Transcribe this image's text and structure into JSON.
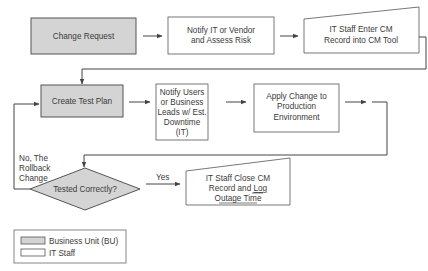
{
  "diagram": {
    "colors": {
      "business_unit_fill": "#d4d4d4",
      "it_staff_fill": "#ffffff",
      "stroke": "#555555",
      "text": "#3a3a3a"
    },
    "nodes": {
      "change_request": {
        "label": "Change Request",
        "owner": "Business Unit (BU)"
      },
      "notify_it": {
        "line1": "Notify IT or Vendor",
        "line2": "and Assess Risk",
        "owner": "IT Staff"
      },
      "enter_cm": {
        "line1": "IT Staff Enter CM",
        "line2": "Record into CM Tool",
        "owner": "IT Staff"
      },
      "create_test_plan": {
        "label": "Create Test Plan",
        "owner": "Business Unit (BU)"
      },
      "notify_users": {
        "line1": "Notify Users",
        "line2": "or Business",
        "line3": "Leads w/ Est.",
        "line4": "Downtime",
        "line5": "(IT)",
        "owner": "IT Staff"
      },
      "apply_change": {
        "line1": "Apply Change to",
        "line2": "Production",
        "line3": "Environment",
        "owner": "IT Staff"
      },
      "tested_correctly": {
        "label": "Tested Correctly?",
        "owner": "Business Unit (BU)"
      },
      "close_cm": {
        "line1": "IT Staff Close CM",
        "line2a": "Record and ",
        "line2b": "Log",
        "line3": "Outage Time",
        "owner": "IT Staff"
      }
    },
    "edges": {
      "yes_label": "Yes",
      "no_line1": "No, The",
      "no_line2": "Rollback",
      "no_line3": "Change"
    },
    "legend": {
      "items": [
        {
          "label": "Business Unit (BU)",
          "fill": "#d4d4d4"
        },
        {
          "label": "IT Staff",
          "fill": "#ffffff"
        }
      ]
    }
  }
}
